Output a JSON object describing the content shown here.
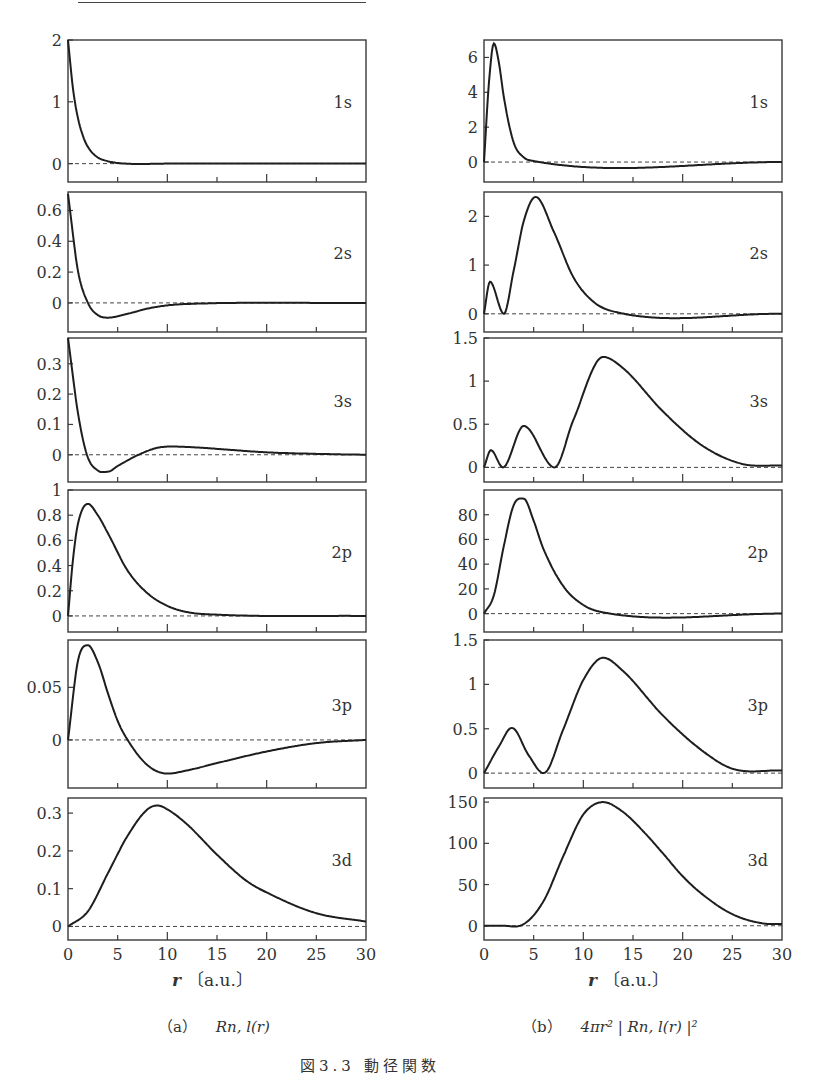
{
  "figure": {
    "title": "図3.3 動径関数",
    "x_axis_label": "r〔a.u.〕",
    "x_ticks": [
      "0",
      "5",
      "10",
      "15",
      "20",
      "25",
      "30"
    ],
    "caption_a": "（a） R_{n,l}(r)",
    "caption_a_prefix": "（a）",
    "caption_a_expr": "Rn, l(r)",
    "caption_b_prefix": "（b）",
    "caption_b_expr": "4πr² | Rn, l(r) |²"
  },
  "chart_data": [
    {
      "type": "line",
      "column": "a",
      "orbital": "1s",
      "title": "1s",
      "xlabel": "r [a.u.]",
      "ylabel": "R_{n,l}(r)",
      "xlim": [
        0,
        30
      ],
      "ylim": [
        -0.2,
        2.0
      ],
      "yticks": [
        "0",
        "1",
        "2"
      ],
      "x": [
        0,
        0.5,
        1,
        1.5,
        2,
        3,
        4,
        5,
        10,
        30
      ],
      "values": [
        2.0,
        1.21,
        0.74,
        0.45,
        0.27,
        0.1,
        0.04,
        0.01,
        0.0,
        0.0
      ]
    },
    {
      "type": "line",
      "column": "a",
      "orbital": "2s",
      "title": "2s",
      "xlabel": "r [a.u.]",
      "ylabel": "R_{n,l}(r)",
      "xlim": [
        0,
        30
      ],
      "ylim": [
        -0.15,
        0.72
      ],
      "yticks": [
        "0",
        "0.2",
        "0.4",
        "0.6"
      ],
      "x": [
        0,
        1,
        2,
        3,
        4,
        6,
        8,
        10,
        12,
        30
      ],
      "values": [
        0.707,
        0.21,
        0.0,
        -0.079,
        -0.096,
        -0.071,
        -0.037,
        -0.016,
        -0.007,
        0.0
      ]
    },
    {
      "type": "line",
      "column": "a",
      "orbital": "3s",
      "title": "3s",
      "xlabel": "r [a.u.]",
      "ylabel": "R_{n,l}(r)",
      "xlim": [
        0,
        30
      ],
      "ylim": [
        -0.07,
        0.385
      ],
      "yticks": [
        "0",
        "0.1",
        "0.2",
        "0.3"
      ],
      "x": [
        0,
        1,
        1.9,
        3,
        4,
        5,
        7.1,
        9,
        10.5,
        13,
        16,
        20,
        25,
        30
      ],
      "values": [
        0.385,
        0.139,
        0.0,
        -0.052,
        -0.056,
        -0.037,
        0.0,
        0.023,
        0.027,
        0.024,
        0.017,
        0.008,
        0.003,
        0.0
      ]
    },
    {
      "type": "line",
      "column": "a",
      "orbital": "2p",
      "title": "2p",
      "xlabel": "r [a.u.]",
      "ylabel": "R_{n,l}(r)",
      "xlim": [
        0,
        30
      ],
      "ylim": [
        -0.08,
        1.0
      ],
      "yticks": [
        "0",
        "0.2",
        "0.4",
        "0.6",
        "0.8",
        "1"
      ],
      "x": [
        0,
        0.5,
        1,
        2,
        3,
        4,
        6,
        8,
        10,
        12,
        15,
        30
      ],
      "values": [
        0.0,
        0.45,
        0.73,
        0.89,
        0.8,
        0.66,
        0.36,
        0.18,
        0.08,
        0.03,
        0.01,
        0.0
      ]
    },
    {
      "type": "line",
      "column": "a",
      "orbital": "3p",
      "title": "3p",
      "xlabel": "r [a.u.]",
      "ylabel": "R_{n,l}(r)",
      "xlim": [
        0,
        30
      ],
      "ylim": [
        -0.04,
        0.095
      ],
      "yticks": [
        "0",
        "0.05"
      ],
      "x": [
        0,
        1,
        2,
        3,
        4,
        5,
        6,
        8,
        10,
        12,
        15,
        20,
        25,
        30
      ],
      "values": [
        0.0,
        0.075,
        0.09,
        0.074,
        0.045,
        0.018,
        0.0,
        -0.024,
        -0.032,
        -0.029,
        -0.022,
        -0.011,
        -0.003,
        0.0
      ]
    },
    {
      "type": "line",
      "column": "a",
      "orbital": "3d",
      "title": "3d",
      "xlabel": "r [a.u.]",
      "ylabel": "R_{n,l}(r)",
      "xlim": [
        0,
        30
      ],
      "ylim": [
        -0.02,
        0.34
      ],
      "yticks": [
        "0",
        "0.1",
        "0.2",
        "0.3"
      ],
      "x": [
        0,
        2,
        4,
        6,
        8,
        9,
        10,
        12,
        15,
        18,
        20,
        25,
        30
      ],
      "values": [
        0.0,
        0.04,
        0.14,
        0.24,
        0.31,
        0.32,
        0.31,
        0.27,
        0.19,
        0.12,
        0.09,
        0.035,
        0.013
      ]
    },
    {
      "type": "line",
      "column": "b",
      "orbital": "1s",
      "title": "1s",
      "xlabel": "r [a.u.]",
      "ylabel": "4πr²|R_{n,l}(r)|²",
      "xlim": [
        0,
        30
      ],
      "ylim": [
        -0.8,
        7.0
      ],
      "yticks": [
        "0",
        "2",
        "4",
        "6"
      ],
      "x": [
        0,
        0.5,
        1,
        1.5,
        2,
        3,
        4,
        5,
        30
      ],
      "values": [
        0.0,
        4.6,
        6.8,
        5.7,
        3.7,
        1.1,
        0.27,
        0.06,
        0.0
      ]
    },
    {
      "type": "line",
      "column": "b",
      "orbital": "2s",
      "title": "2s",
      "xlabel": "r [a.u.]",
      "ylabel": "4πr²|R_{n,l}(r)|²",
      "xlim": [
        0,
        30
      ],
      "ylim": [
        -0.25,
        2.5
      ],
      "yticks": [
        "0",
        "1",
        "2"
      ],
      "x": [
        0,
        0.6,
        2,
        3,
        4,
        5.2,
        7,
        9,
        11,
        13,
        30
      ],
      "values": [
        0.0,
        0.66,
        0.0,
        0.9,
        1.9,
        2.4,
        1.7,
        0.75,
        0.25,
        0.05,
        0.0
      ]
    },
    {
      "type": "line",
      "column": "b",
      "orbital": "3s",
      "title": "3s",
      "xlabel": "r [a.u.]",
      "ylabel": "4πr²|R_{n,l}(r)|²",
      "xlim": [
        0,
        30
      ],
      "ylim": [
        -0.1,
        1.5
      ],
      "yticks": [
        "0",
        "0.5",
        "1",
        "1.5"
      ],
      "x": [
        0,
        0.7,
        1.9,
        4,
        7.1,
        9,
        12,
        14,
        18,
        22,
        26,
        30
      ],
      "values": [
        0.0,
        0.2,
        0.0,
        0.48,
        0.0,
        0.55,
        1.28,
        1.15,
        0.65,
        0.25,
        0.04,
        0.02
      ]
    },
    {
      "type": "line",
      "column": "b",
      "orbital": "2p",
      "title": "2p",
      "xlabel": "r [a.u.]",
      "ylabel": "4πr²|R_{n,l}(r)|²",
      "xlim": [
        0,
        30
      ],
      "ylim": [
        -10,
        100
      ],
      "yticks": [
        "0",
        "20",
        "40",
        "60",
        "80"
      ],
      "x": [
        0,
        1,
        2,
        3,
        4,
        5,
        6,
        8,
        10,
        12,
        30
      ],
      "values": [
        0.0,
        15,
        55,
        88,
        93,
        75,
        52,
        22,
        7,
        1,
        0
      ]
    },
    {
      "type": "line",
      "column": "b",
      "orbital": "3p",
      "title": "3p",
      "xlabel": "r [a.u.]",
      "ylabel": "4πr²|R_{n,l}(r)|²",
      "xlim": [
        0,
        30
      ],
      "ylim": [
        -0.1,
        1.5
      ],
      "yticks": [
        "0",
        "0.5",
        "1",
        "1.5"
      ],
      "x": [
        0,
        1.5,
        2.8,
        4.5,
        6,
        8,
        10,
        12,
        14,
        18,
        22,
        25,
        30
      ],
      "values": [
        0.0,
        0.3,
        0.51,
        0.2,
        0.0,
        0.5,
        1.05,
        1.3,
        1.15,
        0.65,
        0.25,
        0.05,
        0.03
      ]
    },
    {
      "type": "line",
      "column": "b",
      "orbital": "3d",
      "title": "3d",
      "xlabel": "r [a.u.]",
      "ylabel": "4πr²|R_{n,l}(r)|²",
      "xlim": [
        0,
        30
      ],
      "ylim": [
        -10,
        155
      ],
      "yticks": [
        "0",
        "50",
        "100",
        "150"
      ],
      "x": [
        0,
        2,
        4,
        6,
        8,
        10,
        12,
        14,
        16,
        18,
        20,
        22,
        25,
        28,
        30
      ],
      "values": [
        0.0,
        0.0,
        2,
        30,
        85,
        135,
        150,
        138,
        115,
        88,
        60,
        38,
        14,
        3,
        2
      ]
    }
  ]
}
